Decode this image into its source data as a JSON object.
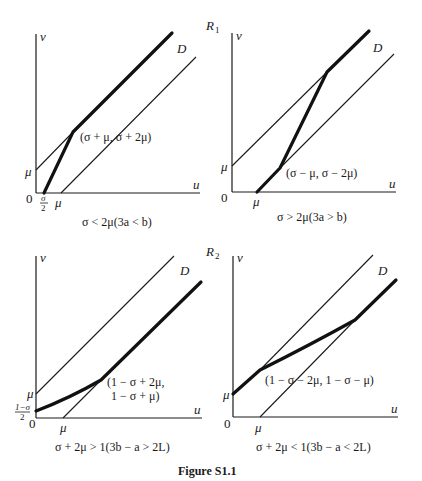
{
  "figure": {
    "caption": "Figure S1.1",
    "region_labels": {
      "r1": "R",
      "r1_sub": "1",
      "r2": "R",
      "r2_sub": "2"
    }
  },
  "panels": [
    {
      "id": "top-left",
      "x_axis_label": "u",
      "y_axis_label": "v",
      "origin_label": "0",
      "y_tick": "μ",
      "x_ticks": [
        "σ/2",
        "μ"
      ],
      "x_tick_frac_num": "σ",
      "x_tick_frac_den": "2",
      "x_tick_mu": "μ",
      "curve_label": "D",
      "point_label": "(σ + μ, σ + 2μ)",
      "condition": "σ < 2μ(3a < b)"
    },
    {
      "id": "top-right",
      "x_axis_label": "u",
      "y_axis_label": "v",
      "origin_label": "0",
      "y_tick": "μ",
      "x_tick_mu": "μ",
      "curve_label": "D",
      "point_label": "(σ − μ, σ − 2μ)",
      "condition": "σ > 2μ(3a > b)"
    },
    {
      "id": "bottom-left",
      "x_axis_label": "u",
      "y_axis_label": "v",
      "origin_label": "0",
      "y_tick": "μ",
      "y_tick_frac_num": "1−σ",
      "y_tick_frac_den": "2",
      "x_tick_mu": "μ",
      "curve_label": "D",
      "point_label_line1": "(1 − σ + 2μ,",
      "point_label_line2": "1 − σ + μ)",
      "condition": "σ + 2μ > 1(3b − a > 2L)"
    },
    {
      "id": "bottom-right",
      "x_axis_label": "u",
      "y_axis_label": "v",
      "origin_label": "0",
      "y_tick": "μ",
      "x_tick_mu": "μ",
      "curve_label": "D",
      "point_label": "(1 − σ − 2μ, 1 − σ − μ)",
      "condition": "σ + 2μ < 1(3b − a < 2L)"
    }
  ]
}
